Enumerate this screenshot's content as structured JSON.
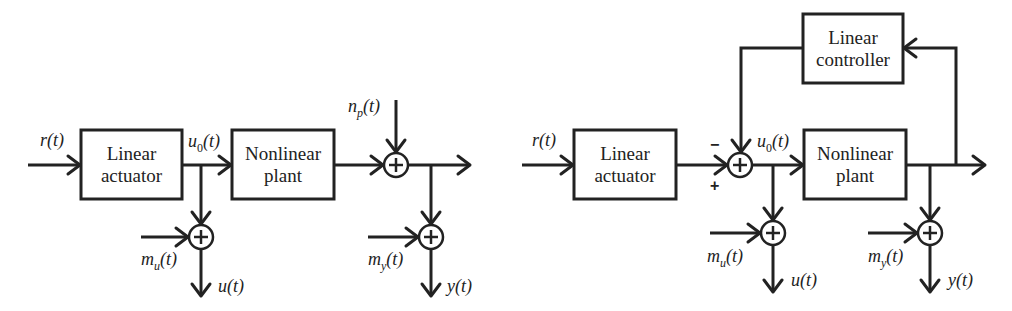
{
  "diagrams": [
    {
      "id": "open-loop",
      "blocks": {
        "actuator": {
          "line1": "Linear",
          "line2": "actuator"
        },
        "plant": {
          "line1": "Nonlinear",
          "line2": "plant"
        }
      },
      "signals": {
        "reference": {
          "base": "r",
          "sub": "",
          "arg": "(t)"
        },
        "actuator_out": {
          "base": "u",
          "sub": "0",
          "arg": "(t)"
        },
        "process_noise": {
          "base": "n",
          "sub": "p",
          "arg": "(t)"
        },
        "input_meas_noise": {
          "base": "m",
          "sub": "u",
          "arg": "(t)"
        },
        "output_meas_noise": {
          "base": "m",
          "sub": "y",
          "arg": "(t)"
        },
        "measured_input": {
          "base": "u",
          "sub": "",
          "arg": "(t)"
        },
        "measured_output": {
          "base": "y",
          "sub": "",
          "arg": "(t)"
        }
      },
      "summing_symbol": "+"
    },
    {
      "id": "closed-loop",
      "blocks": {
        "actuator": {
          "line1": "Linear",
          "line2": "actuator"
        },
        "plant": {
          "line1": "Nonlinear",
          "line2": "plant"
        },
        "controller": {
          "line1": "Linear",
          "line2": "controller"
        }
      },
      "signals": {
        "reference": {
          "base": "r",
          "sub": "",
          "arg": "(t)"
        },
        "actuator_out": {
          "base": "u",
          "sub": "0",
          "arg": "(t)"
        },
        "input_meas_noise": {
          "base": "m",
          "sub": "u",
          "arg": "(t)"
        },
        "output_meas_noise": {
          "base": "m",
          "sub": "y",
          "arg": "(t)"
        },
        "measured_input": {
          "base": "u",
          "sub": "",
          "arg": "(t)"
        },
        "measured_output": {
          "base": "y",
          "sub": "",
          "arg": "(t)"
        }
      },
      "feedback_signs": {
        "top": "−",
        "bottom": "+"
      },
      "summing_symbol": "+"
    }
  ]
}
